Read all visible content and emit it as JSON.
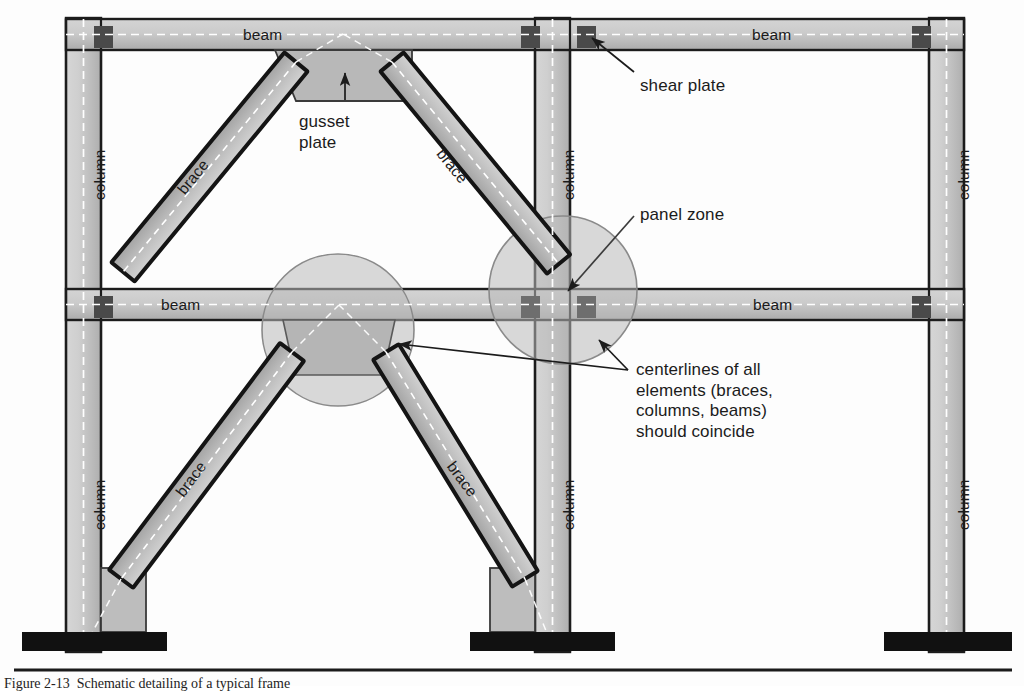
{
  "figure": {
    "caption": "Figure 2-13  Schematic detailing of a typical frame"
  },
  "palette": {
    "member_fill_light": "#c9c9c9",
    "member_fill_mid": "#b9b9b9",
    "gusset_fill": "#b5b5b5",
    "outline_dark": "#1c1c1c",
    "outline_mid": "#555555",
    "shear_plate": "#4a4a4a",
    "base_plate": "#111111",
    "zone_circle_fill": "#bdbdbd",
    "zone_circle_stroke": "#8a8a8a",
    "centerline": "#ffffff",
    "background": "#fdfdfd",
    "annotation_line": "#1b1b1b"
  },
  "members": {
    "beam_label": "beam",
    "column_label": "column",
    "brace_label": "brace",
    "beams": [
      {
        "name": "top-beam-left",
        "label": "beam",
        "label_x": 243,
        "label_y": 34
      },
      {
        "name": "top-beam-right",
        "label": "beam",
        "label_x": 752,
        "label_y": 34
      },
      {
        "name": "mid-beam-left",
        "label": "beam",
        "label_x": 161,
        "label_y": 304
      },
      {
        "name": "mid-beam-right",
        "label": "beam",
        "label_x": 753,
        "label_y": 304
      }
    ],
    "columns": [
      {
        "name": "column-left-upper",
        "label": "column",
        "label_x": 83,
        "label_y": 165
      },
      {
        "name": "column-left-lower",
        "label": "column",
        "label_x": 83,
        "label_y": 492
      },
      {
        "name": "column-mid-upper",
        "label": "column",
        "label_x": 552,
        "label_y": 165
      },
      {
        "name": "column-mid-lower",
        "label": "column",
        "label_x": 552,
        "label_y": 492
      },
      {
        "name": "column-right-upper",
        "label": "column",
        "label_x": 947,
        "label_y": 165
      },
      {
        "name": "column-right-lower",
        "label": "column",
        "label_x": 947,
        "label_y": 492
      }
    ],
    "braces": [
      {
        "name": "brace-upper-left",
        "label": "brace",
        "label_x": 196,
        "label_y": 176,
        "angle": -52
      },
      {
        "name": "brace-upper-right",
        "label": "brace",
        "label_x": 452,
        "label_y": 164,
        "angle": 52
      },
      {
        "name": "brace-lower-left",
        "label": "brace",
        "label_x": 192,
        "label_y": 478,
        "angle": -52
      },
      {
        "name": "brace-lower-right",
        "label": "brace",
        "label_x": 460,
        "label_y": 478,
        "angle": 52
      }
    ]
  },
  "annotations": [
    {
      "name": "gusset-plate",
      "text": "gusset\nplate",
      "x": 299,
      "y": 112,
      "arrow_from": [
        345,
        98
      ],
      "arrow_to": [
        345,
        72
      ]
    },
    {
      "name": "shear-plate",
      "text": "shear plate",
      "x": 640,
      "y": 76,
      "arrow_from": [
        632,
        75
      ],
      "arrow_to": [
        592,
        36
      ]
    },
    {
      "name": "panel-zone",
      "text": "panel zone",
      "x": 640,
      "y": 205,
      "arrow_from": [
        632,
        218
      ],
      "arrow_to": [
        566,
        292
      ]
    },
    {
      "name": "centerlines-note",
      "text": "centerlines of all\nelements (braces,\ncolumns, beams)\nshould coincide",
      "x": 636,
      "y": 362,
      "arrow_from": [
        628,
        372
      ],
      "arrow_to_a": [
        400,
        345
      ],
      "arrow_to_b": [
        598,
        341
      ]
    }
  ]
}
